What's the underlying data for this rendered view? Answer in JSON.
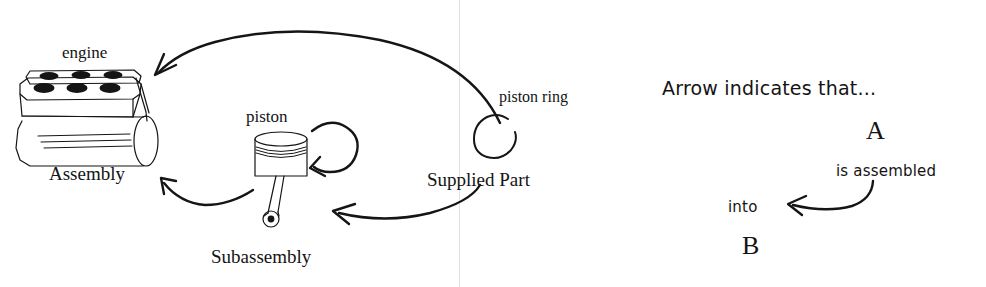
{
  "canvas": {
    "width": 986,
    "height": 287,
    "background": "#ffffff",
    "ink": "#151515"
  },
  "diagram": {
    "type": "hand-drawn assembly relationship diagram",
    "parts": [
      {
        "id": "engine",
        "part_label": "engine",
        "role_label": "Assembly",
        "icon": "engine-block-drawing"
      },
      {
        "id": "piston",
        "part_label": "piston",
        "role_label": "Subassembly",
        "icon": "piston-drawing"
      },
      {
        "id": "piston-ring",
        "part_label": "piston ring",
        "role_label": "Supplied Part",
        "icon": "piston-ring-drawing"
      }
    ],
    "labels": {
      "engine": "engine",
      "assembly": "Assembly",
      "piston": "piston",
      "subassembly": "Subassembly",
      "piston_ring": "piston ring",
      "supplied_part": "Supplied Part"
    },
    "arrows": [
      {
        "name": "piston-ring-into-engine",
        "from": "piston ring",
        "to": "engine",
        "shape": "long-top-arc"
      },
      {
        "name": "piston-ring-into-piston",
        "from": "piston ring",
        "to": "piston",
        "shape": "bottom-arc"
      },
      {
        "name": "piston-ring-onto-piston",
        "from": "piston ring",
        "to": "piston",
        "shape": "self-loop"
      },
      {
        "name": "piston-into-engine",
        "from": "piston",
        "to": "engine",
        "shape": "left-arc"
      }
    ]
  },
  "legend": {
    "title": "Arrow indicates that...",
    "source": "A",
    "relation": "is assembled",
    "preposition": "into",
    "target": "B"
  }
}
